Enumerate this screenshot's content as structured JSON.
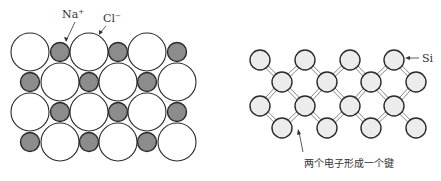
{
  "nacl": {
    "labels": {
      "na": "Na",
      "na_sup": "+",
      "cl": "Cl",
      "cl_sup": "−"
    },
    "colors": {
      "cl_fill": "#ffffff",
      "na_fill": "#8c8c8c",
      "stroke": "#2a2a2a"
    },
    "rows": [
      {
        "y": 52,
        "pattern": "L S L S L S"
      },
      {
        "y": 82,
        "pattern": "S L S L S L"
      },
      {
        "y": 112,
        "pattern": "L S L S L S"
      },
      {
        "y": 142,
        "pattern": "S L S L S L"
      }
    ]
  },
  "si": {
    "label": "Si",
    "caption": "两个电子形成一个键",
    "colors": {
      "fill": "#ececec",
      "stroke": "#2a2a2a",
      "bond": "#777777"
    }
  }
}
